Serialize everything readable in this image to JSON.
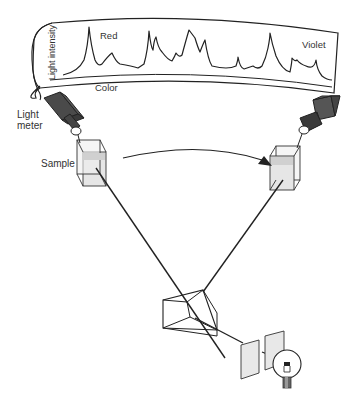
{
  "colors": {
    "stroke": "#222222",
    "meter_body": "#555555",
    "meter_dark": "#3a3a3a",
    "cuvette_fill": "#e6e6e6",
    "cuvette_liquid": "#d2d2d2",
    "slit_fill": "#e8e8e8",
    "background": "#ffffff"
  },
  "spectrum_panel": {
    "y_axis_label": "Light intensity",
    "x_axis_label": "Color",
    "left_end_label": "Red",
    "right_end_label": "Violet"
  },
  "labels": {
    "light_meter": [
      "Light",
      "meter"
    ],
    "sample": "Sample"
  },
  "components": [
    {
      "id": "light-bulb",
      "name": "Light source"
    },
    {
      "id": "slits",
      "name": "Slits"
    },
    {
      "id": "prism",
      "name": "Prism"
    },
    {
      "id": "sample-left",
      "name": "Sample cuvette (initial position)"
    },
    {
      "id": "sample-right",
      "name": "Sample cuvette (scanned position)"
    },
    {
      "id": "meter-left",
      "name": "Light meter (initial position)"
    },
    {
      "id": "meter-right",
      "name": "Light meter (scanned position)"
    },
    {
      "id": "sweep-arrow",
      "name": "Rotation/scan arrow"
    }
  ]
}
